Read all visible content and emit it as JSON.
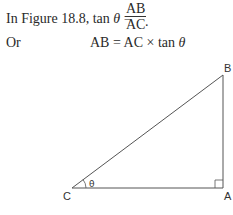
{
  "text": {
    "line1_prefix": "In Figure 18.8, tan ",
    "theta": "θ",
    "equals": " =",
    "frac_num": "AB",
    "frac_den": "AC",
    "period": ".",
    "line2_word": "Or",
    "line2_eq_left": "AB = AC × tan ",
    "line2_theta": "θ"
  },
  "figure": {
    "label_B": "B",
    "label_C": "C",
    "label_A": "A",
    "angle_label": "θ",
    "stroke_color": "#555555"
  }
}
